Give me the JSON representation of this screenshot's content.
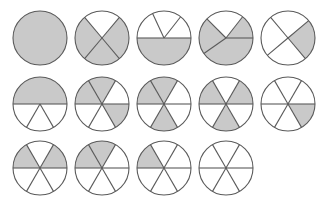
{
  "figure": {
    "width": 324,
    "height": 205,
    "background_color": "#ffffff",
    "shaded_color": "#c9c9c9",
    "unshaded_color": "#ffffff",
    "stroke_color": "#5a5a5a",
    "stroke_width": 1.1,
    "radius": 27,
    "rows": 3,
    "columns": 5
  },
  "circles": [
    {
      "id": "circle-1",
      "row": 1,
      "column": 1,
      "cx": 40,
      "cy": 38,
      "denominator": 1,
      "numerator": 1,
      "fraction_label": "1/1",
      "start_angle": 0,
      "cuts": [],
      "shaded_sectors": [
        0
      ]
    },
    {
      "id": "circle-2",
      "row": 1,
      "column": 2,
      "cx": 102,
      "cy": 38,
      "denominator": 4,
      "numerator": 3,
      "fraction_label": "3/4",
      "start_angle": 50,
      "cuts": [
        50,
        130,
        230,
        310
      ],
      "shaded_sectors": [
        1,
        2,
        3
      ]
    },
    {
      "id": "circle-3",
      "row": 1,
      "column": 3,
      "cx": 164,
      "cy": 38,
      "denominator": 4,
      "numerator": 2,
      "fraction_label": "2/4",
      "start_angle": 0,
      "cuts": [
        0,
        52,
        115,
        180
      ],
      "shaded_sectors": [
        3
      ]
    },
    {
      "id": "circle-4",
      "row": 1,
      "column": 4,
      "cx": 226,
      "cy": 38,
      "denominator": 4,
      "numerator": 2,
      "fraction_label": "2/4",
      "start_angle": 0,
      "cuts": [
        0,
        52,
        135,
        215
      ],
      "shaded_sectors": [
        0,
        2,
        3
      ]
    },
    {
      "id": "circle-5",
      "row": 1,
      "column": 5,
      "cx": 288,
      "cy": 38,
      "denominator": 4,
      "numerator": 1,
      "fraction_label": "1/4",
      "start_angle": 0,
      "cuts": [
        40,
        130,
        220,
        310
      ],
      "shaded_sectors": [
        3
      ]
    },
    {
      "id": "circle-6",
      "row": 2,
      "column": 1,
      "cx": 40,
      "cy": 104,
      "denominator": 6,
      "numerator": 3,
      "fraction_label": "3/6",
      "start_angle": 0,
      "cuts": [
        0,
        180,
        240,
        300
      ],
      "shaded_sectors": [
        0
      ]
    },
    {
      "id": "circle-7",
      "row": 2,
      "column": 2,
      "cx": 102,
      "cy": 104,
      "denominator": 6,
      "numerator": 3,
      "fraction_label": "3/6",
      "start_angle": 0,
      "cuts": [
        0,
        60,
        120,
        180,
        240,
        300
      ],
      "shaded_sectors": [
        1,
        2,
        5
      ]
    },
    {
      "id": "circle-8",
      "row": 2,
      "column": 3,
      "cx": 164,
      "cy": 104,
      "denominator": 6,
      "numerator": 3,
      "fraction_label": "3/6",
      "start_angle": 0,
      "cuts": [
        0,
        60,
        120,
        180,
        240,
        300
      ],
      "shaded_sectors": [
        1,
        2,
        4
      ]
    },
    {
      "id": "circle-9",
      "row": 2,
      "column": 4,
      "cx": 226,
      "cy": 104,
      "denominator": 6,
      "numerator": 3,
      "fraction_label": "3/6",
      "start_angle": 0,
      "cuts": [
        0,
        60,
        120,
        180,
        240,
        300
      ],
      "shaded_sectors": [
        0,
        2,
        4
      ]
    },
    {
      "id": "circle-10",
      "row": 2,
      "column": 5,
      "cx": 288,
      "cy": 104,
      "denominator": 6,
      "numerator": 1,
      "fraction_label": "1/6",
      "start_angle": 0,
      "cuts": [
        0,
        60,
        120,
        180,
        240,
        300
      ],
      "shaded_sectors": [
        5
      ]
    },
    {
      "id": "circle-11",
      "row": 3,
      "column": 1,
      "cx": 40,
      "cy": 168,
      "denominator": 6,
      "numerator": 2,
      "fraction_label": "2/6",
      "start_angle": 0,
      "cuts": [
        0,
        60,
        120,
        180,
        240,
        300
      ],
      "shaded_sectors": [
        0,
        2
      ]
    },
    {
      "id": "circle-12",
      "row": 3,
      "column": 2,
      "cx": 102,
      "cy": 168,
      "denominator": 6,
      "numerator": 2,
      "fraction_label": "2/6",
      "start_angle": 0,
      "cuts": [
        0,
        60,
        120,
        180,
        240,
        300
      ],
      "shaded_sectors": [
        1,
        2
      ]
    },
    {
      "id": "circle-13",
      "row": 3,
      "column": 3,
      "cx": 164,
      "cy": 168,
      "denominator": 6,
      "numerator": 1,
      "fraction_label": "1/6",
      "start_angle": 0,
      "cuts": [
        0,
        60,
        120,
        180,
        240,
        300
      ],
      "shaded_sectors": [
        2
      ]
    },
    {
      "id": "circle-14",
      "row": 3,
      "column": 4,
      "cx": 226,
      "cy": 168,
      "denominator": 6,
      "numerator": 0,
      "fraction_label": "0/6",
      "start_angle": 0,
      "cuts": [
        0,
        60,
        120,
        180,
        240,
        300
      ],
      "shaded_sectors": []
    }
  ]
}
